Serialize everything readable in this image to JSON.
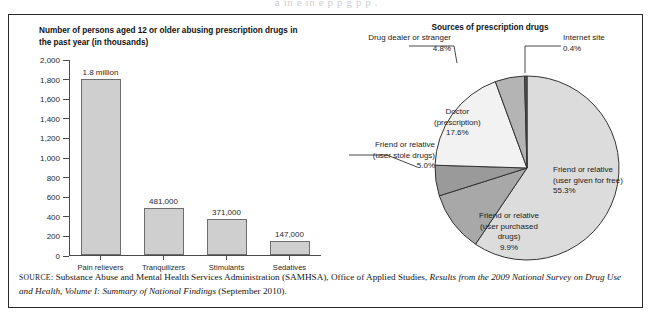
{
  "ghost_text": "a    in    e   in     e     p      p      g          p            p       .",
  "figure": {
    "source_note": {
      "label": "SOURCE",
      "separator": ": ",
      "part1": "Substance Abuse and Mental Health Services Administration (SAMHSA), Office of Applied Studies, ",
      "italic1": "Results from the 2009 National Survey on Drug Use and Health, Volume I: Summary of National Findings",
      "part2": " (September 2010)."
    }
  },
  "chart_data": [
    {
      "type": "bar",
      "title": "Number of persons aged 12 or older abusing prescription drugs in the past year (in thousands)",
      "xlabel": "",
      "ylabel": "",
      "ylim": [
        0,
        2000
      ],
      "grid": false,
      "categories": [
        "Pain relievers",
        "Tranquilizers",
        "Stimulants",
        "Sedatives"
      ],
      "values": [
        1800,
        481,
        371,
        147
      ],
      "value_labels": [
        "1.8 million",
        "481,000",
        "371,000",
        "147,000"
      ],
      "ytick_labels": [
        "0",
        "200",
        "400",
        "600",
        "800",
        "1,000",
        "1,200",
        "1,400",
        "1,600",
        "1,800",
        "2,000"
      ],
      "ytick_values": [
        0,
        200,
        400,
        600,
        800,
        1000,
        1200,
        1400,
        1600,
        1800,
        2000
      ],
      "bar_fill": "#cfcfcf",
      "bar_stroke": "#6d6d6d"
    },
    {
      "type": "pie",
      "title": "Sources of prescription drugs",
      "legend_position": "callout-labels",
      "start_angle_deg": 0,
      "direction": "clockwise",
      "slices": [
        {
          "label": "Friend or relative (user given for free)",
          "label_lines": [
            "Friend or relative",
            "(user given for free)",
            "55.3%"
          ],
          "value": 55.3,
          "percent_text": "55.3%",
          "color": "#dcdcdc"
        },
        {
          "label": "Friend or relative (user purchased drugs)",
          "label_lines": [
            "Friend or relative",
            "(user purchased",
            "drugs)",
            "9.9%"
          ],
          "value": 9.9,
          "percent_text": "9.9%",
          "color": "#a8a8a8"
        },
        {
          "label": "Friend or relative (user stole drugs)",
          "label_lines": [
            "Friend or relative",
            "(user stole drugs)",
            "5.0%"
          ],
          "value": 5.0,
          "percent_text": "5.0%",
          "color": "#9a9a9a"
        },
        {
          "label": "Doctor (prescription)",
          "label_lines": [
            "Doctor",
            "(prescription)",
            "17.6%"
          ],
          "value": 17.6,
          "percent_text": "17.6%",
          "color": "#f2f2f2"
        },
        {
          "label": "Drug dealer or stranger",
          "label_lines": [
            "Drug dealer or stranger",
            "4.8%"
          ],
          "value": 4.8,
          "percent_text": "4.8%",
          "color": "#b4b4b4"
        },
        {
          "label": "Internet site",
          "label_lines": [
            "Internet site",
            "0.4%"
          ],
          "value": 0.4,
          "percent_text": "0.4%",
          "color": "#575757"
        }
      ]
    }
  ]
}
